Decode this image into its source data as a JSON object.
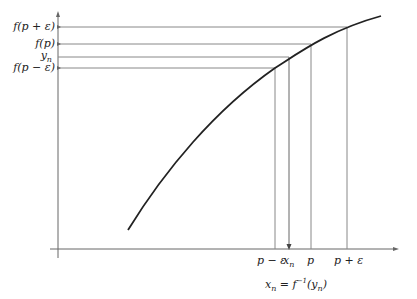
{
  "diagram": {
    "y_labels": [
      "f(p + ε)",
      "f(p)",
      "yn",
      "f(p − ε)"
    ],
    "x_labels": [
      "p − ε",
      "xn",
      "p",
      "p + ε"
    ],
    "caption": "xn = f⁻¹(yn)",
    "colors": {
      "curve": "#222222",
      "guide": "#888888",
      "axis": "#555555"
    }
  },
  "labels": {
    "f_p_plus": "f(p + ε)",
    "f_p": "f(p)",
    "y_n": "y",
    "y_n_sub": "n",
    "f_p_minus": "f(p − ε)",
    "p_minus": "p − ε",
    "x_n": "x",
    "x_n_sub": "n",
    "p": "p",
    "p_plus": "p + ε",
    "cap_x": "x",
    "cap_sub": "n",
    "cap_eq": " = f",
    "cap_sup": "−1",
    "cap_y": "(y",
    "cap_ysub": "n",
    "cap_close": ")"
  }
}
